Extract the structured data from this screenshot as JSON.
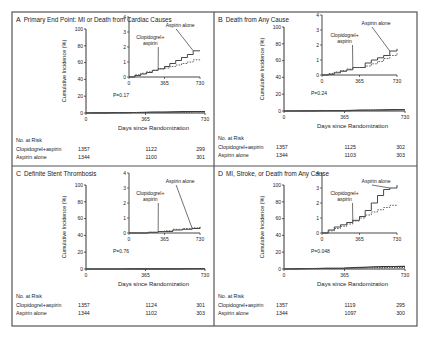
{
  "figure": {
    "x_axis_label": "Days since Randomization",
    "y_axis_label": "Cumulative Incidence (%)",
    "risk_header": "No. at Risk",
    "group_labels": [
      "Clopidogrel+aspirin",
      "Aspirin alone"
    ],
    "main_y_ticks": [
      0,
      20,
      40,
      60,
      80,
      100
    ],
    "main_x_ticks": [
      0,
      365,
      730
    ],
    "inset_y_ticks": [
      0,
      1,
      2,
      3,
      4
    ],
    "inset_x_ticks": [
      0,
      365,
      730
    ],
    "colors": {
      "border": "#555555",
      "axis": "#333333",
      "solid": "#333333",
      "dashed": "#555555"
    }
  },
  "chart_data": [
    {
      "panel": "A",
      "type": "line",
      "title": "Primary End Point: MI or Death from Cardiac Causes",
      "xlabel": "Days since Randomization",
      "ylabel": "Cumulative Incidence (%)",
      "xlim": [
        0,
        730
      ],
      "ylim": [
        0,
        100
      ],
      "inset_ylim": [
        0,
        4
      ],
      "p_value": "P=0.17",
      "series": [
        {
          "name": "Aspirin alone",
          "style": "solid",
          "x": [
            0,
            60,
            120,
            180,
            240,
            300,
            365,
            420,
            480,
            540,
            600,
            660,
            730
          ],
          "y": [
            0,
            0.1,
            0.2,
            0.3,
            0.45,
            0.55,
            0.7,
            0.9,
            1.1,
            1.3,
            1.5,
            1.75,
            1.75
          ]
        },
        {
          "name": "Clopidogrel+aspirin",
          "style": "dashed",
          "x": [
            0,
            60,
            120,
            180,
            240,
            300,
            365,
            420,
            480,
            540,
            600,
            660,
            730
          ],
          "y": [
            0,
            0.15,
            0.25,
            0.35,
            0.45,
            0.55,
            0.6,
            0.7,
            0.8,
            0.9,
            1.0,
            1.15,
            1.2
          ]
        }
      ],
      "annotations": [
        "Aspirin alone",
        "Clopidogrel+ aspirin"
      ],
      "at_risk": {
        "Clopidogrel+aspirin": [
          1357,
          1122,
          299
        ],
        "Aspirin alone": [
          1344,
          1100,
          301
        ]
      }
    },
    {
      "panel": "B",
      "type": "line",
      "title": "Death from Any Cause",
      "xlabel": "Days since Randomization",
      "ylabel": "Cumulative Incidence (%)",
      "xlim": [
        0,
        730
      ],
      "ylim": [
        0,
        100
      ],
      "inset_ylim": [
        0,
        4
      ],
      "p_value": "P=0.24",
      "series": [
        {
          "name": "Aspirin alone",
          "style": "solid",
          "x": [
            0,
            60,
            120,
            180,
            240,
            300,
            365,
            420,
            480,
            540,
            600,
            660,
            730
          ],
          "y": [
            0,
            0.05,
            0.15,
            0.25,
            0.35,
            0.5,
            0.5,
            0.8,
            1.0,
            1.15,
            1.3,
            1.6,
            1.75
          ]
        },
        {
          "name": "Clopidogrel+aspirin",
          "style": "dashed",
          "x": [
            0,
            60,
            120,
            180,
            240,
            300,
            365,
            420,
            480,
            540,
            600,
            660,
            730
          ],
          "y": [
            0,
            0.1,
            0.2,
            0.3,
            0.4,
            0.5,
            0.5,
            0.6,
            0.75,
            0.9,
            1.1,
            1.3,
            1.45
          ]
        }
      ],
      "annotations": [
        "Aspirin alone",
        "Clopidogrel+ aspirin"
      ],
      "at_risk": {
        "Clopidogrel+aspirin": [
          1357,
          1125,
          302
        ],
        "Aspirin alone": [
          1344,
          1103,
          303
        ]
      }
    },
    {
      "panel": "C",
      "type": "line",
      "title": "Definite Stent Thrombosis",
      "xlabel": "Days since Randomization",
      "ylabel": "Cumulative Incidence (%)",
      "xlim": [
        0,
        730
      ],
      "ylim": [
        0,
        100
      ],
      "inset_ylim": [
        0,
        4
      ],
      "p_value": "P=0.76",
      "series": [
        {
          "name": "Aspirin alone",
          "style": "solid",
          "x": [
            0,
            100,
            200,
            300,
            365,
            450,
            550,
            650,
            730
          ],
          "y": [
            0,
            0.0,
            0.05,
            0.1,
            0.1,
            0.2,
            0.25,
            0.3,
            0.4
          ]
        },
        {
          "name": "Clopidogrel+aspirin",
          "style": "dashed",
          "x": [
            0,
            100,
            200,
            300,
            365,
            450,
            550,
            650,
            730
          ],
          "y": [
            0,
            0.0,
            0.05,
            0.1,
            0.15,
            0.25,
            0.3,
            0.35,
            0.45
          ]
        }
      ],
      "annotations": [
        "Aspirin alone",
        "Clopidogrel+ aspirin"
      ],
      "at_risk": {
        "Clopidogrel+aspirin": [
          1357,
          1124,
          301
        ],
        "Aspirin alone": [
          1344,
          1102,
          303
        ]
      }
    },
    {
      "panel": "D",
      "type": "line",
      "title": "MI, Stroke, or Death from Any Cause",
      "xlabel": "Days since Randomization",
      "ylabel": "Cumulative Incidence (%)",
      "xlim": [
        0,
        730
      ],
      "ylim": [
        0,
        100
      ],
      "inset_ylim": [
        0,
        4
      ],
      "p_value": "P=0.048",
      "series": [
        {
          "name": "Aspirin alone",
          "style": "solid",
          "x": [
            0,
            60,
            120,
            180,
            240,
            300,
            365,
            420,
            480,
            540,
            600,
            660,
            730
          ],
          "y": [
            0,
            0.2,
            0.4,
            0.55,
            0.7,
            0.85,
            1.1,
            1.5,
            2.0,
            2.5,
            2.9,
            3.0,
            3.2
          ]
        },
        {
          "name": "Clopidogrel+aspirin",
          "style": "dashed",
          "x": [
            0,
            60,
            120,
            180,
            240,
            300,
            365,
            420,
            480,
            540,
            600,
            660,
            730
          ],
          "y": [
            0,
            0.15,
            0.3,
            0.45,
            0.6,
            0.8,
            1.0,
            1.2,
            1.4,
            1.55,
            1.7,
            1.85,
            1.85
          ]
        }
      ],
      "annotations": [
        "Aspirin alone",
        "Clopidogrel+ aspirin"
      ],
      "at_risk": {
        "Clopidogrel+aspirin": [
          1357,
          1119,
          295
        ],
        "Aspirin alone": [
          1344,
          1097,
          300
        ]
      }
    }
  ]
}
